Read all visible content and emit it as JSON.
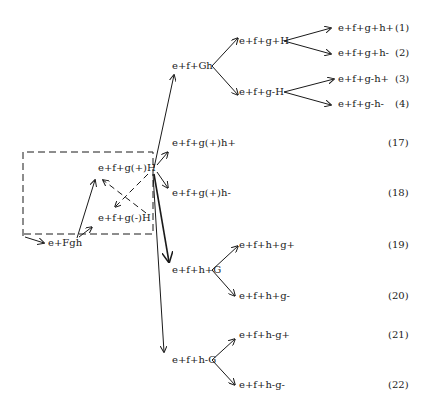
{
  "diagram": {
    "nodes": {
      "root": "e+Fgh",
      "g_plus_H": "e+f+g(+)H",
      "g_minus_H": "e+f+g(-)H",
      "f_Gh": "e+f+Gh",
      "fgH_plus": "e+f+g+H",
      "fgH_minus": "e+f+g-H",
      "leaf1": "e+f+g+h+",
      "leaf2": "e+f+g+h-",
      "leaf3": "e+f+g-h+",
      "leaf4": "e+f+g-h-",
      "leaf17": "e+f+g(+)h+",
      "leaf18": "e+f+g(+)h-",
      "fh_plus_G": "e+f+h+G",
      "fh_minus_G": "e+f+h-G",
      "leaf19": "e+f+h+g+",
      "leaf20": "e+f+h+g-",
      "leaf21": "e+f+h-g+",
      "leaf22": "e+f+h-g-"
    },
    "numbers": {
      "n1": "(1)",
      "n2": "(2)",
      "n3": "(3)",
      "n4": "(4)",
      "n17": "(17)",
      "n18": "(18)",
      "n19": "(19)",
      "n20": "(20)",
      "n21": "(21)",
      "n22": "(22)"
    },
    "line_color": "#1a1a1a"
  }
}
